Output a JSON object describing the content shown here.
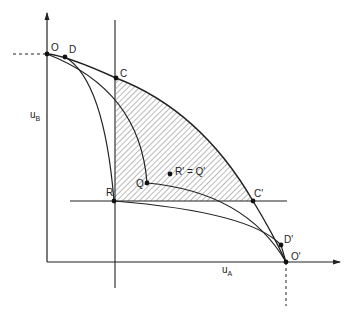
{
  "diagram": {
    "axes": {
      "y_label": "u",
      "y_label_sub": "B",
      "x_label": "u",
      "x_label_sub": "A"
    },
    "points": {
      "O": "O",
      "D": "D",
      "C": "C",
      "R": "R",
      "Q": "Q",
      "RQprime": "R' = Q'",
      "Cprime": "C'",
      "Dprime": "D'",
      "Oprime": "O'"
    },
    "colors": {
      "line": "#222222",
      "hatch": "#555555",
      "background": "#ffffff"
    }
  }
}
